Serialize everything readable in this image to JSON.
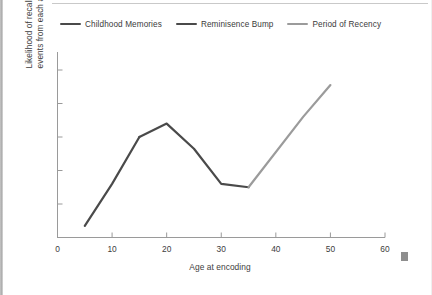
{
  "chart_data": {
    "type": "line",
    "title": "",
    "xlabel": "Age at encoding",
    "ylabel": "Likelihood of recalling events from each age",
    "ylabel_line1": "Likelihood of recalling",
    "ylabel_line2": "events from each age",
    "xlim": [
      0,
      60
    ],
    "ylim": [
      0,
      100
    ],
    "xticks": [
      0,
      10,
      20,
      30,
      40,
      50,
      60
    ],
    "xtick_labels": [
      "0",
      "10",
      "20",
      "30",
      "40",
      "50",
      "60"
    ],
    "yticks": [],
    "ytick_labels": [],
    "grid": false,
    "legend_position": "top",
    "series": [
      {
        "name": "Childhood Memories",
        "color": "#4a4a4a",
        "x": [
          5,
          10,
          15
        ],
        "y": [
          7,
          32,
          60
        ]
      },
      {
        "name": "Reminisence Bump",
        "color": "#4a4a4a",
        "x": [
          15,
          20,
          25,
          30,
          35
        ],
        "y": [
          60,
          68,
          53,
          32,
          30
        ]
      },
      {
        "name": "Period of Recency",
        "color": "#9b9b9b",
        "x": [
          35,
          45,
          50
        ],
        "y": [
          30,
          72,
          91
        ]
      }
    ],
    "annotations": []
  },
  "legend": {
    "items": [
      {
        "label": "Childhood Memories",
        "color": "#4a4a4a"
      },
      {
        "label": "Reminisence Bump",
        "color": "#4a4a4a"
      },
      {
        "label": "Period of Recency",
        "color": "#9b9b9b"
      }
    ]
  },
  "axes": {
    "axis_color": "#9a9a9a"
  }
}
